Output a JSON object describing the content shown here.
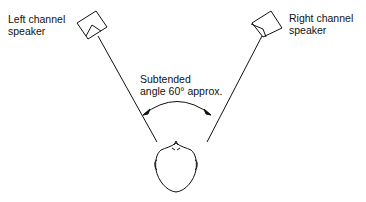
{
  "diagram": {
    "labels": {
      "left_speaker": "Left channel\nspeaker",
      "right_speaker": "Right channel\nspeaker",
      "angle": "Subtended\nangle 60° approx."
    },
    "elements": [
      "left-speaker-icon",
      "right-speaker-icon",
      "listener-head-icon",
      "angle-arc"
    ],
    "colors": {
      "stroke": "#111111",
      "background": "#ffffff"
    }
  }
}
